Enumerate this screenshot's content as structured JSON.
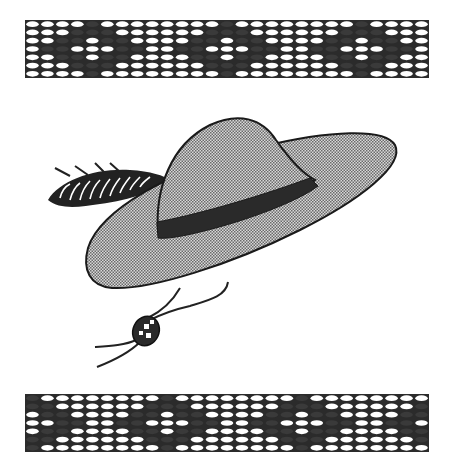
{
  "image": {
    "description": "Black-and-white clip art of a wide-brimmed hat with a dark band, a feather plume on the left, and a chin cord with a bead, framed above and below by beaded lace bands",
    "colors": {
      "background": "#ffffff",
      "ink": "#1a1a1a",
      "hat_fill": "#a8a8a8",
      "hat_band": "#2a2a2a",
      "bead_light": "#ffffff",
      "bead_dark": "#2b2b2b"
    }
  },
  "top_band": {
    "label": "beaded band top",
    "rows": 7,
    "cols": 27
  },
  "bottom_band": {
    "label": "beaded band bottom",
    "rows": 7,
    "cols": 27
  },
  "hat": {
    "label": "hat with feather"
  }
}
